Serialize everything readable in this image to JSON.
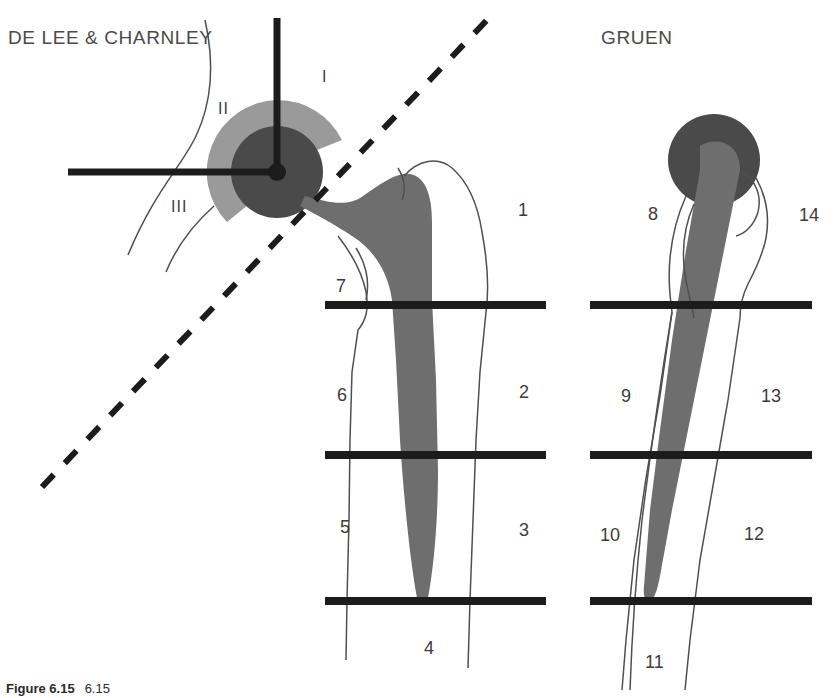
{
  "figure": {
    "title_left": "DE LEE & CHARNLEY",
    "title_right": "GRUEN",
    "caption_label": "Figure 6.15",
    "caption_text": "6.15"
  },
  "colors": {
    "background": "#ffffff",
    "head_dark": "#4a4a4a",
    "cup_gray": "#9a9a9a",
    "stem_gray": "#6e6e6e",
    "line_black": "#1c1c1c",
    "bone_outline": "#4f4f4f",
    "text": "#3c3c3c"
  },
  "acetabular_zones": {
    "system": "DE LEE & CHARNLEY",
    "labels": [
      {
        "id": "I",
        "x": 322,
        "y": 68
      },
      {
        "id": "II",
        "x": 218,
        "y": 100
      },
      {
        "id": "III",
        "x": 171,
        "y": 198
      }
    ]
  },
  "femoral_zones": {
    "system": "GRUEN",
    "left_stem": [
      {
        "id": "1",
        "x": 518,
        "y": 200
      },
      {
        "id": "2",
        "x": 519,
        "y": 382
      },
      {
        "id": "3",
        "x": 519,
        "y": 520
      },
      {
        "id": "4",
        "x": 424,
        "y": 638
      },
      {
        "id": "5",
        "x": 340,
        "y": 517
      },
      {
        "id": "6",
        "x": 337,
        "y": 385
      },
      {
        "id": "7",
        "x": 336,
        "y": 276
      }
    ],
    "right_stem": [
      {
        "id": "8",
        "x": 648,
        "y": 204
      },
      {
        "id": "9",
        "x": 621,
        "y": 386
      },
      {
        "id": "10",
        "x": 600,
        "y": 525
      },
      {
        "id": "11",
        "x": 645,
        "y": 652
      },
      {
        "id": "12",
        "x": 744,
        "y": 524
      },
      {
        "id": "13",
        "x": 761,
        "y": 386
      },
      {
        "id": "14",
        "x": 799,
        "y": 205
      }
    ]
  },
  "divider_lines": [
    {
      "name": "left-divider-upper",
      "x1": 325,
      "y": 305,
      "x2": 546
    },
    {
      "name": "left-divider-middle",
      "x1": 325,
      "y": 455,
      "x2": 546
    },
    {
      "name": "left-divider-lower",
      "x1": 325,
      "y": 601,
      "x2": 546
    },
    {
      "name": "right-divider-upper",
      "x1": 590,
      "y": 305,
      "x2": 812
    },
    {
      "name": "right-divider-middle",
      "x1": 590,
      "y": 455,
      "x2": 812
    },
    {
      "name": "right-divider-lower",
      "x1": 590,
      "y": 601,
      "x2": 812
    }
  ],
  "crosshair": {
    "vertical": {
      "x": 277,
      "y1": 18,
      "y2": 172
    },
    "horizontal": {
      "y": 172,
      "x1": 68,
      "x2": 277
    },
    "center": {
      "x": 277,
      "y": 172
    }
  },
  "dashed_line": {
    "x1": 42,
    "y1": 487,
    "x2": 487,
    "y2": 20
  }
}
